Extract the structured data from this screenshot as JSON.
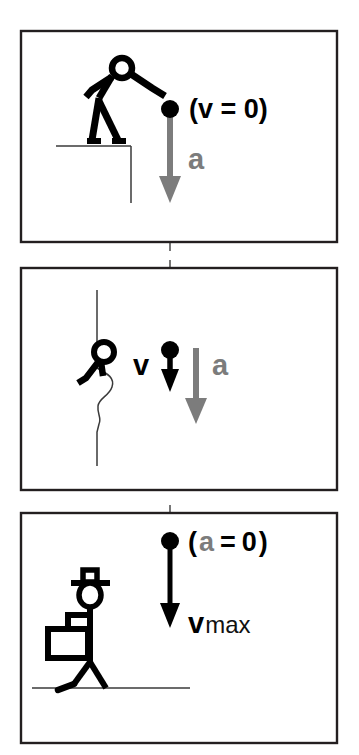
{
  "figure": {
    "background_color": "#ffffff",
    "frame_color": "#231f20",
    "velocity_color": "#000000",
    "acceleration_color": "#7c7c7c",
    "panel_count": 3
  },
  "panels": [
    {
      "id": "panel-top",
      "index": 1,
      "description": "Person on cliff edge releasing the ball",
      "actor": "person-releasing-ball",
      "ball_label": "ball",
      "annotation": {
        "open_paren": "(",
        "symbol": "v",
        "equals": "=",
        "value": "0",
        "close_paren": ")",
        "full_text": "(v = 0)",
        "symbol_color": "#000000"
      },
      "vector": {
        "name": "a",
        "label": "a",
        "kind": "acceleration",
        "color": "#7c7c7c",
        "direction": "down",
        "length": "long"
      },
      "ground": "cliff-top-with-drop-off"
    },
    {
      "id": "panel-middle",
      "index": 2,
      "description": "Person peering over cliff edge as ball falls",
      "actor": "person-peering-over-edge",
      "ball_label": "ball",
      "vectors": [
        {
          "name": "v",
          "label": "v",
          "kind": "velocity",
          "color": "#000000",
          "direction": "down",
          "length": "short"
        },
        {
          "name": "a",
          "label": "a",
          "kind": "acceleration",
          "color": "#7c7c7c",
          "direction": "down",
          "length": "long"
        }
      ],
      "ground": "cliff-face-vertical"
    },
    {
      "id": "panel-bottom",
      "index": 3,
      "description": "Observer with hard hat on the ground as ball reaches maximum speed",
      "actor": "person-with-hard-hat-holding-clipboard",
      "ball_label": "ball",
      "annotation": {
        "open_paren": "(",
        "symbol": "a",
        "equals": "=",
        "value": "0",
        "close_paren": ")",
        "full_text": "(a = 0)",
        "symbol_color": "#7c7c7c"
      },
      "vector": {
        "name": "v_max",
        "label": "v",
        "subscript": "max",
        "kind": "velocity",
        "color": "#000000",
        "direction": "down",
        "length": "long"
      },
      "ground": "flat-ground-line"
    }
  ],
  "guide": {
    "name": "fall-path",
    "style": "dashed-vertical",
    "color": "#555555"
  }
}
